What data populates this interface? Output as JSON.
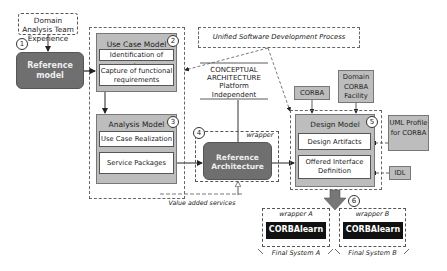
{
  "domain_analysis": "Domain Analysis Team Experience",
  "reference_model": "Reference model",
  "steps": [
    "1",
    "2",
    "3",
    "4",
    "5",
    "6"
  ],
  "use_case_model": {
    "title": "Use Case Model",
    "items": [
      "Identification of actors",
      "Capture of functional requirements"
    ]
  },
  "analysis_model": {
    "title": "Analysis Model",
    "items": [
      "Use Case Realization",
      "Service Packages"
    ]
  },
  "unified_process": "Unified Software Development Process",
  "conceptual": {
    "line1": "CONCEPTUAL",
    "line2": "ARCHITECTURE",
    "line3": "Platform",
    "line4": "Independent"
  },
  "wrapper_label": "wrapper",
  "reference_architecture": "Reference Architecture",
  "value_added_services": "Value added services",
  "corba": "CORBA",
  "domain_corba_facility": "Domain CORBA Facility",
  "design_model": {
    "title": "Design Model",
    "items": [
      "Design Artifacts",
      "Offered Interface Definition"
    ]
  },
  "uml_profile": "UML Profile for CORBA",
  "idl": "IDL",
  "final_systems": [
    {
      "wrapper": "wrapper A",
      "product": "CORBAlearn",
      "label": "Final System A"
    },
    {
      "wrapper": "wrapper B",
      "product": "CORBAlearn",
      "label": "Final System B"
    }
  ]
}
